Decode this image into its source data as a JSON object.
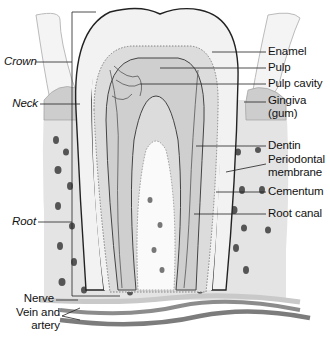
{
  "figure": {
    "colors": {
      "background": "#ffffff",
      "enamel": "#f1f1f1",
      "dentin": "#dcdcdc",
      "pulp": "#c9c9c9",
      "bone": "#e3e3e3",
      "gum": "#cfcfcf",
      "vessel": "#8a8a8a",
      "outline": "#333333",
      "label_text": "#111111"
    }
  },
  "labels": {
    "left": [
      {
        "text": "Crown",
        "style": "italic"
      },
      {
        "text": "Neck",
        "style": "italic"
      },
      {
        "text": "Root",
        "style": "italic"
      },
      {
        "text": "Nerve",
        "style": "normal"
      },
      {
        "text": "Vein and",
        "style": "normal"
      },
      {
        "text": "artery",
        "style": "normal"
      }
    ],
    "right": [
      {
        "text": "Enamel"
      },
      {
        "text": "Pulp"
      },
      {
        "text": "Pulp cavity"
      },
      {
        "text": "Gingiva"
      },
      {
        "text": "(gum)"
      },
      {
        "text": "Dentin"
      },
      {
        "text": "Periodontal"
      },
      {
        "text": "membrane"
      },
      {
        "text": "Cementum"
      },
      {
        "text": "Root canal"
      }
    ]
  }
}
